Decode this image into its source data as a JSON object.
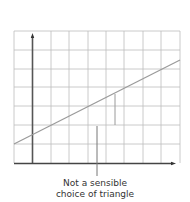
{
  "diagram": {
    "grid": {
      "cols": 9,
      "rows": 7,
      "color": "#bdbdbd"
    },
    "axes": {
      "color": "#444444"
    },
    "line": {
      "color": "#9a9a9a",
      "from": [
        14,
        144
      ],
      "to": [
        180,
        60
      ]
    },
    "annotation": {
      "line1": "Not a sensible",
      "line2": "choice of triangle"
    }
  }
}
